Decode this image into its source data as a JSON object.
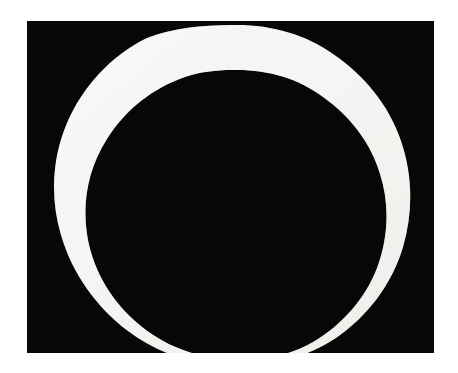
{
  "image": {
    "title": "Ensō — hand-painted white circle on black field",
    "kind": "natural-image",
    "medium": "photograph of painted ring",
    "canvas": {
      "width": 458,
      "height": 373,
      "background_color": "#ffffff"
    },
    "plate": {
      "name": "photographic plate",
      "left": 27,
      "top": 21,
      "width": 407,
      "height": 332,
      "background_color": "#070707",
      "border_color": "#070707"
    },
    "subject": {
      "name": "painted ring",
      "shape": "annulus",
      "stroke_color": "#f2f1ee",
      "fill_color": "#070707",
      "center_x": 204,
      "center_y": 167,
      "outer_radius_avg": 163,
      "inner_radius_avg": 118,
      "band_thickness_avg": 45,
      "edge_quality": "irregular, organic, hand-painted",
      "outer_path": "M 204 4 C 243 3 278 13 306 33 C 337 54 362 84 374 120 C 386 155 386 192 376 226 C 365 263 341 295 309 317 C 277 338 239 347 203 345 C 166 344 130 332 101 310 C 69 286 45 252 34 214 C 23 177 25 137 40 102 C 56 65 85 34 120 17 C 146 7 175 4 204 4 Z",
      "inner_path": "M 205 49 C 239 48 271 57 296 76 C 323 95 344 122 353 153 C 363 184 361 218 350 247 C 338 278 315 304 286 321 C 258 337 224 342 193 338 C 161 334 131 321 108 300 C 82 277 65 246 60 213 C 55 180 62 146 80 118 C 98 89 126 67 158 56 C 173 51 189 49 205 49 Z"
    },
    "palette": {
      "page_white": "#ffffff",
      "plate_black": "#070707",
      "ring_white": "#f2f1ee",
      "ring_shadow": "#dcdbd6"
    }
  }
}
